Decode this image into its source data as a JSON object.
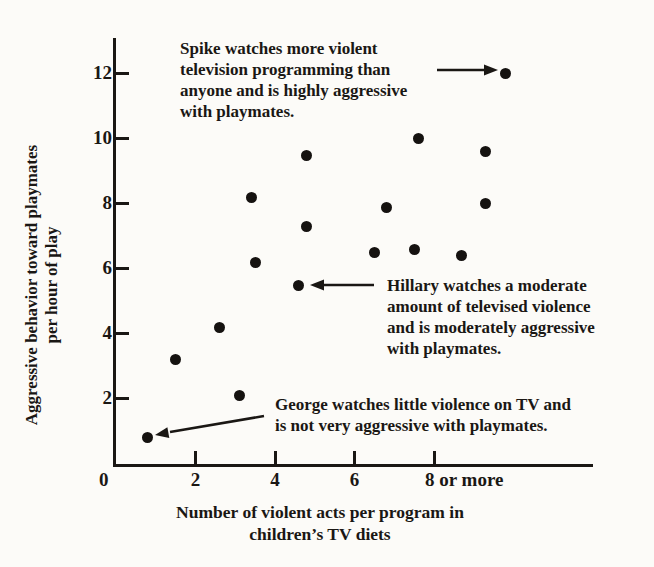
{
  "figure": {
    "background": "#fcfbf8",
    "ink": "#1a1714",
    "dot_color": "#151210"
  },
  "chart_data": {
    "type": "scatter",
    "title": "",
    "xlabel": "Number of violent acts per program in children’s TV diets",
    "ylabel": "Aggressive behavior toward playmates per hour of play",
    "grid": false,
    "legend": false,
    "x_axis": {
      "label_line1": "Number of violent acts per program in",
      "label_line2": "children’s TV diets",
      "origin_label": "0",
      "range": [
        0,
        12
      ],
      "ticks": [
        {
          "value": 2,
          "label": "2",
          "align": "center"
        },
        {
          "value": 4,
          "label": "4",
          "align": "center"
        },
        {
          "value": 6,
          "label": "6",
          "align": "center"
        },
        {
          "value": 8,
          "label": "8 or more",
          "align": "start"
        }
      ]
    },
    "y_axis": {
      "label_line1": "Aggressive behavior toward playmates",
      "label_line2": "per hour of play",
      "range": [
        0,
        13.1
      ],
      "ticks": [
        {
          "value": 2,
          "label": "2"
        },
        {
          "value": 4,
          "label": "4"
        },
        {
          "value": 6,
          "label": "6"
        },
        {
          "value": 8,
          "label": "8"
        },
        {
          "value": 10,
          "label": "10"
        },
        {
          "value": 12,
          "label": "12"
        }
      ]
    },
    "points": [
      {
        "x": 0.8,
        "y": 0.8,
        "label": "George"
      },
      {
        "x": 1.5,
        "y": 3.2
      },
      {
        "x": 2.6,
        "y": 4.2
      },
      {
        "x": 3.1,
        "y": 2.1
      },
      {
        "x": 3.4,
        "y": 8.2
      },
      {
        "x": 3.5,
        "y": 6.2
      },
      {
        "x": 4.6,
        "y": 5.5,
        "label": "Hillary"
      },
      {
        "x": 4.8,
        "y": 7.3
      },
      {
        "x": 4.8,
        "y": 9.5
      },
      {
        "x": 6.5,
        "y": 6.5
      },
      {
        "x": 6.8,
        "y": 7.9
      },
      {
        "x": 7.5,
        "y": 6.6
      },
      {
        "x": 7.6,
        "y": 10.0
      },
      {
        "x": 8.7,
        "y": 6.4
      },
      {
        "x": 9.3,
        "y": 8.0
      },
      {
        "x": 9.3,
        "y": 9.6
      },
      {
        "x": 9.8,
        "y": 12.0,
        "label": "Spike"
      }
    ],
    "annotations": {
      "spike": {
        "lines": [
          "Spike watches more violent",
          "television programming than",
          "anyone and is highly aggressive",
          "with playmates."
        ],
        "points_to": "Spike"
      },
      "hillary": {
        "lines": [
          "Hillary watches a moderate",
          "amount of televised violence",
          "and is moderately aggressive",
          "with playmates."
        ],
        "points_to": "Hillary"
      },
      "george": {
        "lines": [
          "George watches little violence on TV and",
          "is not very aggressive with playmates."
        ],
        "points_to": "George"
      }
    }
  }
}
